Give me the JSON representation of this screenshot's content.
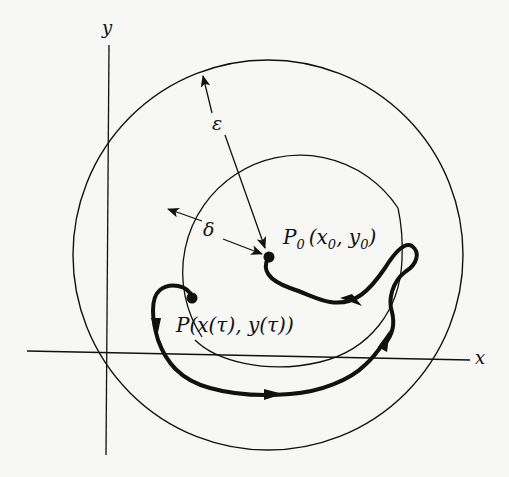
{
  "figure": {
    "background": "#f7f7f5",
    "ink": "#111111"
  },
  "axes": {
    "x_label": "x",
    "y_label": "y"
  },
  "circles": {
    "outer_label": "ε",
    "inner_label": "δ"
  },
  "points": {
    "p0": {
      "name": "P",
      "subscript": "0",
      "coords": "(x",
      "coords_sub1": "0",
      "coords_mid": ", y",
      "coords_sub2": "0",
      "coords_end": ")"
    },
    "p": {
      "label": "P(x(τ), y(τ))"
    }
  }
}
